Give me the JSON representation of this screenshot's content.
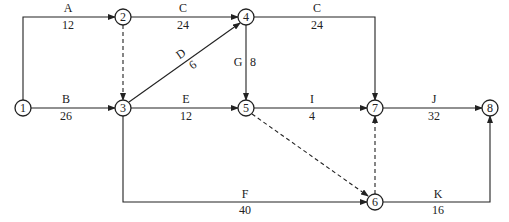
{
  "header": {
    "cropped_text": ""
  },
  "nodes": [
    {
      "id": "1",
      "label": "1",
      "x": 23,
      "y": 108
    },
    {
      "id": "2",
      "label": "2",
      "x": 123,
      "y": 17
    },
    {
      "id": "3",
      "label": "3",
      "x": 123,
      "y": 108
    },
    {
      "id": "4",
      "label": "4",
      "x": 246,
      "y": 17
    },
    {
      "id": "5",
      "label": "5",
      "x": 246,
      "y": 108
    },
    {
      "id": "6",
      "label": "6",
      "x": 375,
      "y": 202
    },
    {
      "id": "7",
      "label": "7",
      "x": 375,
      "y": 108
    },
    {
      "id": "8",
      "label": "8",
      "x": 490,
      "y": 108
    }
  ],
  "activities": [
    {
      "name": "A",
      "duration": "12",
      "from": "1",
      "to": "2"
    },
    {
      "name": "B",
      "duration": "26",
      "from": "1",
      "to": "3"
    },
    {
      "name": "C",
      "duration": "24",
      "from": "2",
      "to": "4"
    },
    {
      "name": "C",
      "duration": "24",
      "from": "4",
      "to": "7"
    },
    {
      "name": "D",
      "duration": "6",
      "from": "3",
      "to": "4"
    },
    {
      "name": "E",
      "duration": "12",
      "from": "3",
      "to": "5"
    },
    {
      "name": "G",
      "duration": "8",
      "from": "4",
      "to": "5"
    },
    {
      "name": "I",
      "duration": "4",
      "from": "5",
      "to": "7"
    },
    {
      "name": "J",
      "duration": "32",
      "from": "7",
      "to": "8"
    },
    {
      "name": "F",
      "duration": "40",
      "from": "3",
      "to": "6"
    },
    {
      "name": "K",
      "duration": "16",
      "from": "6",
      "to": "8"
    }
  ],
  "dummy_activities": [
    {
      "from": "2",
      "to": "3"
    },
    {
      "from": "5",
      "to": "6"
    },
    {
      "from": "6",
      "to": "7"
    }
  ]
}
